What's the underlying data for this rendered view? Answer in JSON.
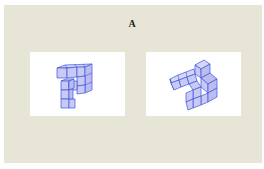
{
  "figure": {
    "label": "A",
    "background_color": "#e6e5d6",
    "stimuli": [
      {
        "id": "left",
        "description": "3D cube assembly (Shepard-Metzler style), orientation 1",
        "cube_color": "#c9caf2",
        "edge_color": "#3c55e0"
      },
      {
        "id": "right",
        "description": "3D cube assembly (Shepard-Metzler style), rotated orientation",
        "cube_color": "#c9caf2",
        "edge_color": "#3c55e0"
      }
    ]
  }
}
